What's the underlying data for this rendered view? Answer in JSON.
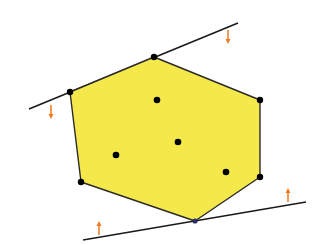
{
  "diagram": {
    "type": "convex-hull-with-supporting-lines",
    "colors": {
      "fill": "#f5e84a",
      "edge": "#2a2a2a",
      "point": "#000000",
      "line": "#1a1a1a",
      "arrow": "#f07a1e",
      "bottom_vertex": "#2a2f6a"
    },
    "hull_vertices": [
      {
        "x": 154,
        "y": 57
      },
      {
        "x": 260,
        "y": 100
      },
      {
        "x": 260,
        "y": 177
      },
      {
        "x": 195,
        "y": 221
      },
      {
        "x": 81,
        "y": 182
      },
      {
        "x": 70,
        "y": 92
      }
    ],
    "interior_points": [
      {
        "x": 157,
        "y": 100
      },
      {
        "x": 178,
        "y": 142
      },
      {
        "x": 116,
        "y": 155
      },
      {
        "x": 226,
        "y": 172
      }
    ],
    "supporting_lines": [
      {
        "name": "upper",
        "x1": 29,
        "y1": 109,
        "x2": 238,
        "y2": 23
      },
      {
        "name": "lower",
        "x1": 83,
        "y1": 240,
        "x2": 306,
        "y2": 202
      }
    ],
    "arrows": [
      {
        "name": "upper-right",
        "x": 228,
        "y": 37,
        "dir": "down"
      },
      {
        "name": "upper-left",
        "x": 51,
        "y": 112,
        "dir": "down"
      },
      {
        "name": "lower-left",
        "x": 99,
        "y": 228,
        "dir": "up"
      },
      {
        "name": "lower-right",
        "x": 288,
        "y": 195,
        "dir": "up"
      }
    ]
  }
}
